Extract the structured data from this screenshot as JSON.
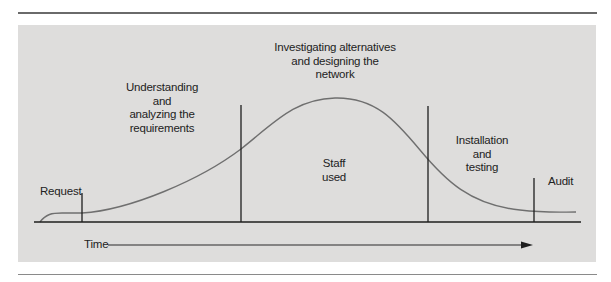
{
  "diagram": {
    "type": "staffing-curve-over-project-phases",
    "phases": [
      {
        "id": "request",
        "label": "Request"
      },
      {
        "id": "understanding",
        "lines": [
          "Understanding",
          "and",
          "analyzing the",
          "requirements"
        ]
      },
      {
        "id": "investigating",
        "lines": [
          "Investigating alternatives",
          "and designing the",
          "network"
        ]
      },
      {
        "id": "installation",
        "lines": [
          "Installation",
          "and",
          "testing"
        ]
      },
      {
        "id": "audit",
        "label": "Audit"
      }
    ],
    "curve_label": [
      "Staff",
      "used"
    ],
    "x_axis_label": "Time",
    "colors": {
      "panel": "#dedddc",
      "curve": "#6f6f6f",
      "lines": "#1e1e1e",
      "rules": "#6a6a6a"
    }
  }
}
